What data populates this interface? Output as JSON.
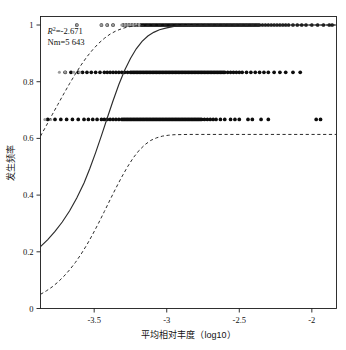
{
  "figure": {
    "name": "neutral-community-model-plot",
    "background": "#ffffff",
    "point_color": "#0d0d0d",
    "point_color_light": "#9a9a9a",
    "curve_color": "#2b2b2b"
  },
  "annotations": {
    "r2_label": "R",
    "r2_sup": "2",
    "r2_value": "=-2.671",
    "r2_full": "R2=-2.671",
    "nm_text": "Nm=5 643"
  },
  "axes": {
    "x_title": "平均相对丰度（log10）",
    "y_title": "发生频率",
    "x_ticks": [
      "-3.5",
      "-3",
      "-2.5",
      "-2"
    ],
    "x_tick_values": [
      -3.5,
      -3,
      -2.5,
      -2
    ],
    "y_ticks": [
      "0",
      "0.2",
      "0.4",
      "0.6",
      "0.8",
      "1"
    ],
    "y_tick_values": [
      0,
      0.2,
      0.4,
      0.6,
      0.8,
      1
    ],
    "xlim": [
      -3.87,
      -1.83
    ],
    "ylim": [
      0,
      1.03
    ],
    "grid": false
  },
  "chart_data": {
    "type": "scatter",
    "title": "",
    "subtitle": "",
    "xlabel": "平均相对丰度（log10）",
    "ylabel": "发生频率",
    "xlim": [
      -3.87,
      -1.83
    ],
    "ylim": [
      0,
      1.03
    ],
    "grid": false,
    "legend": null,
    "annotations": [
      "R2=-2.671",
      "Nm=5 643"
    ],
    "series": [
      {
        "name": "观测OTU点（频率=1）",
        "type": "scatter",
        "color": "#0d0d0d",
        "y_level": 1.0,
        "x": [
          -3.62,
          -3.45,
          -3.41,
          -3.37,
          -3.3,
          -3.28,
          -3.26,
          -3.24,
          -3.22,
          -3.2,
          -3.18,
          -3.17,
          -3.16,
          -3.15,
          -3.14,
          -3.13,
          -3.12,
          -3.11,
          -3.1,
          -3.09,
          -3.08,
          -3.07,
          -3.06,
          -3.05,
          -3.04,
          -3.03,
          -3.02,
          -3.01,
          -3.0,
          -2.99,
          -2.98,
          -2.97,
          -2.96,
          -2.95,
          -2.94,
          -2.93,
          -2.92,
          -2.91,
          -2.9,
          -2.89,
          -2.88,
          -2.87,
          -2.86,
          -2.85,
          -2.84,
          -2.83,
          -2.82,
          -2.81,
          -2.8,
          -2.79,
          -2.78,
          -2.77,
          -2.76,
          -2.75,
          -2.74,
          -2.73,
          -2.72,
          -2.71,
          -2.7,
          -2.69,
          -2.68,
          -2.67,
          -2.66,
          -2.65,
          -2.64,
          -2.63,
          -2.62,
          -2.61,
          -2.6,
          -2.59,
          -2.58,
          -2.57,
          -2.56,
          -2.55,
          -2.54,
          -2.53,
          -2.52,
          -2.51,
          -2.5,
          -2.49,
          -2.48,
          -2.47,
          -2.46,
          -2.45,
          -2.44,
          -2.43,
          -2.42,
          -2.41,
          -2.4,
          -2.39,
          -2.38,
          -2.37,
          -2.36,
          -2.34,
          -2.32,
          -2.3,
          -2.28,
          -2.26,
          -2.24,
          -2.22,
          -2.2,
          -2.18,
          -2.16,
          -2.13,
          -2.1,
          -2.07,
          -2.04,
          -2.0,
          -1.96,
          -1.92,
          -1.88,
          -1.86
        ]
      },
      {
        "name": "观测OTU点（频率=1，浅色）",
        "type": "scatter",
        "color": "#9a9a9a",
        "y_level": 1.0,
        "x": [
          -3.62,
          -3.45,
          -3.41,
          -3.37,
          -3.31,
          -3.29,
          -3.27,
          -3.25,
          -3.23,
          -3.21,
          -3.19
        ]
      },
      {
        "name": "观测OTU点（频率≈0.833）",
        "type": "scatter",
        "color": "#0d0d0d",
        "y_level": 0.833,
        "x": [
          -3.7,
          -3.66,
          -3.61,
          -3.58,
          -3.55,
          -3.52,
          -3.49,
          -3.46,
          -3.43,
          -3.41,
          -3.39,
          -3.37,
          -3.35,
          -3.33,
          -3.31,
          -3.29,
          -3.27,
          -3.25,
          -3.24,
          -3.23,
          -3.22,
          -3.21,
          -3.2,
          -3.19,
          -3.18,
          -3.17,
          -3.16,
          -3.15,
          -3.14,
          -3.13,
          -3.12,
          -3.11,
          -3.1,
          -3.09,
          -3.08,
          -3.07,
          -3.06,
          -3.05,
          -3.04,
          -3.03,
          -3.02,
          -3.01,
          -3.0,
          -2.99,
          -2.98,
          -2.97,
          -2.96,
          -2.95,
          -2.94,
          -2.93,
          -2.92,
          -2.91,
          -2.9,
          -2.89,
          -2.88,
          -2.87,
          -2.86,
          -2.85,
          -2.84,
          -2.83,
          -2.82,
          -2.81,
          -2.8,
          -2.79,
          -2.78,
          -2.77,
          -2.76,
          -2.75,
          -2.74,
          -2.73,
          -2.72,
          -2.71,
          -2.7,
          -2.69,
          -2.68,
          -2.67,
          -2.66,
          -2.65,
          -2.64,
          -2.63,
          -2.62,
          -2.61,
          -2.6,
          -2.58,
          -2.56,
          -2.54,
          -2.52,
          -2.5,
          -2.48,
          -2.45,
          -2.42,
          -2.39,
          -2.36,
          -2.33,
          -2.3,
          -2.26,
          -2.22,
          -2.18,
          -2.13,
          -2.08
        ]
      },
      {
        "name": "观测OTU点（频率≈0.833，浅色）",
        "type": "scatter",
        "color": "#9a9a9a",
        "y_level": 0.833,
        "x": [
          -3.74,
          -3.7,
          -3.64,
          -3.6
        ]
      },
      {
        "name": "观测OTU点（频率≈0.667）",
        "type": "scatter",
        "color": "#0d0d0d",
        "y_level": 0.667,
        "x": [
          -3.82,
          -3.77,
          -3.73,
          -3.69,
          -3.65,
          -3.61,
          -3.57,
          -3.54,
          -3.51,
          -3.48,
          -3.45,
          -3.43,
          -3.41,
          -3.39,
          -3.37,
          -3.35,
          -3.33,
          -3.31,
          -3.3,
          -3.29,
          -3.28,
          -3.27,
          -3.26,
          -3.25,
          -3.24,
          -3.23,
          -3.22,
          -3.21,
          -3.2,
          -3.19,
          -3.18,
          -3.17,
          -3.16,
          -3.15,
          -3.14,
          -3.13,
          -3.12,
          -3.11,
          -3.1,
          -3.09,
          -3.08,
          -3.07,
          -3.06,
          -3.05,
          -3.04,
          -3.03,
          -3.02,
          -3.01,
          -3.0,
          -2.99,
          -2.98,
          -2.97,
          -2.96,
          -2.95,
          -2.94,
          -2.93,
          -2.92,
          -2.91,
          -2.9,
          -2.89,
          -2.88,
          -2.87,
          -2.86,
          -2.85,
          -2.84,
          -2.83,
          -2.82,
          -2.81,
          -2.8,
          -2.79,
          -2.78,
          -2.77,
          -2.76,
          -2.74,
          -2.72,
          -2.7,
          -2.68,
          -2.66,
          -2.63,
          -2.6,
          -2.56,
          -2.53,
          -2.5,
          -2.44,
          -2.41,
          -2.35,
          -2.3,
          -1.97,
          -1.94
        ]
      },
      {
        "name": "观测OTU点（频率≈0.667，浅色）",
        "type": "scatter",
        "color": "#9a9a9a",
        "y_level": 0.667,
        "x": [
          -3.84,
          -3.8
        ]
      },
      {
        "name": "中性模型拟合曲线",
        "type": "line",
        "style": "solid",
        "color": "#2b2b2b",
        "points": [
          [
            -3.87,
            0.218
          ],
          [
            -3.82,
            0.243
          ],
          [
            -3.77,
            0.272
          ],
          [
            -3.72,
            0.305
          ],
          [
            -3.67,
            0.344
          ],
          [
            -3.62,
            0.39
          ],
          [
            -3.57,
            0.443
          ],
          [
            -3.53,
            0.494
          ],
          [
            -3.49,
            0.55
          ],
          [
            -3.45,
            0.61
          ],
          [
            -3.41,
            0.672
          ],
          [
            -3.37,
            0.733
          ],
          [
            -3.33,
            0.79
          ],
          [
            -3.29,
            0.84
          ],
          [
            -3.25,
            0.882
          ],
          [
            -3.21,
            0.916
          ],
          [
            -3.17,
            0.942
          ],
          [
            -3.13,
            0.961
          ],
          [
            -3.09,
            0.974
          ],
          [
            -3.05,
            0.983
          ],
          [
            -3.0,
            0.99
          ],
          [
            -2.95,
            0.995
          ],
          [
            -2.9,
            0.997
          ],
          [
            -2.8,
            0.999
          ],
          [
            -2.6,
            1.0
          ],
          [
            -2.3,
            1.0
          ],
          [
            -2.0,
            1.0
          ],
          [
            -1.83,
            1.0
          ]
        ]
      },
      {
        "name": "95%置信区间上限",
        "type": "line",
        "style": "dashed",
        "color": "#2b2b2b",
        "points": [
          [
            -3.87,
            0.608
          ],
          [
            -3.83,
            0.645
          ],
          [
            -3.79,
            0.683
          ],
          [
            -3.75,
            0.72
          ],
          [
            -3.71,
            0.757
          ],
          [
            -3.67,
            0.793
          ],
          [
            -3.63,
            0.827
          ],
          [
            -3.59,
            0.859
          ],
          [
            -3.55,
            0.888
          ],
          [
            -3.51,
            0.913
          ],
          [
            -3.47,
            0.935
          ],
          [
            -3.43,
            0.953
          ],
          [
            -3.39,
            0.968
          ],
          [
            -3.35,
            0.979
          ],
          [
            -3.31,
            0.987
          ],
          [
            -3.27,
            0.993
          ],
          [
            -3.23,
            0.996
          ],
          [
            -3.19,
            0.998
          ],
          [
            -3.15,
            0.999
          ],
          [
            -3.1,
            1.0
          ],
          [
            -3.0,
            1.0
          ],
          [
            -2.7,
            1.0
          ],
          [
            -2.3,
            1.0
          ],
          [
            -1.83,
            1.0
          ]
        ]
      },
      {
        "name": "95%置信区间下限",
        "type": "line",
        "style": "dashed",
        "color": "#2b2b2b",
        "points": [
          [
            -3.87,
            0.05
          ],
          [
            -3.83,
            0.062
          ],
          [
            -3.79,
            0.076
          ],
          [
            -3.75,
            0.093
          ],
          [
            -3.71,
            0.113
          ],
          [
            -3.67,
            0.136
          ],
          [
            -3.63,
            0.162
          ],
          [
            -3.59,
            0.192
          ],
          [
            -3.55,
            0.225
          ],
          [
            -3.51,
            0.262
          ],
          [
            -3.47,
            0.301
          ],
          [
            -3.43,
            0.342
          ],
          [
            -3.39,
            0.384
          ],
          [
            -3.35,
            0.425
          ],
          [
            -3.31,
            0.464
          ],
          [
            -3.27,
            0.5
          ],
          [
            -3.23,
            0.532
          ],
          [
            -3.19,
            0.558
          ],
          [
            -3.15,
            0.578
          ],
          [
            -3.11,
            0.593
          ],
          [
            -3.07,
            0.602
          ],
          [
            -3.03,
            0.608
          ],
          [
            -2.99,
            0.611
          ],
          [
            -2.95,
            0.613
          ],
          [
            -2.85,
            0.614
          ],
          [
            -2.6,
            0.614
          ],
          [
            -2.3,
            0.614
          ],
          [
            -2.0,
            0.614
          ],
          [
            -1.83,
            0.614
          ]
        ]
      }
    ]
  }
}
